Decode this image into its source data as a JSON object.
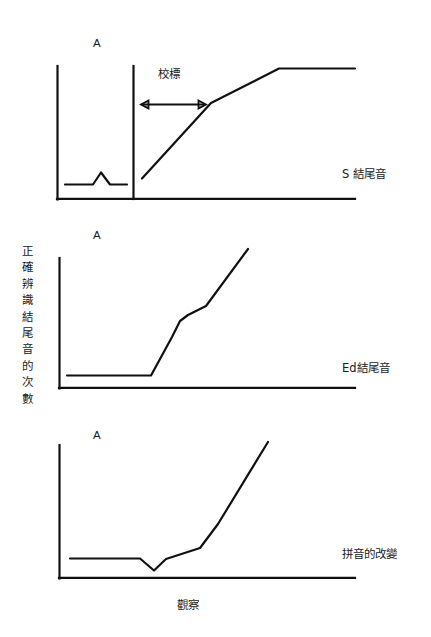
{
  "figure": {
    "y_axis_label": "正確辨識結尾音的次數",
    "y_axis_label_chars": [
      "正",
      "確",
      "辨",
      "識",
      "結",
      "尾",
      "音",
      "的",
      "次",
      "數"
    ],
    "x_axis_label": "觀察",
    "baseline_marker": "A",
    "criterion_label": "校標",
    "panels": [
      {
        "id": "panel-s-ending",
        "series_label": "S 結尾音",
        "phase_marker": "A",
        "criterion_label": "校標"
      },
      {
        "id": "panel-ed-ending",
        "series_label": "Ed結尾音",
        "phase_marker": "A"
      },
      {
        "id": "panel-spelling-change",
        "series_label": "拼音的改變",
        "phase_marker": "A"
      }
    ]
  },
  "chart_data": {
    "type": "line",
    "title": "",
    "xlabel": "觀察",
    "ylabel": "正確辨識結尾音的次數",
    "xlim": [
      0,
      100
    ],
    "ylim": [
      0,
      100
    ],
    "grid": false,
    "legend": "none",
    "annotations": [
      {
        "text": "校標",
        "panel": "panel-s-ending",
        "kind": "criterion-arrow-label"
      },
      {
        "text": "A",
        "panel": "panel-s-ending",
        "kind": "phase-marker"
      },
      {
        "text": "A",
        "panel": "panel-ed-ending",
        "kind": "phase-marker"
      },
      {
        "text": "A",
        "panel": "panel-spelling-change",
        "kind": "phase-marker"
      }
    ],
    "panels": [
      {
        "name": "S 結尾音",
        "phase_divider_x": 26,
        "series": [
          {
            "name": "baseline",
            "points": [
              [
                3,
                12
              ],
              [
                13,
                12
              ],
              [
                16,
                21
              ],
              [
                20,
                12
              ],
              [
                26,
                12
              ]
            ]
          },
          {
            "name": "intervention",
            "points": [
              [
                29,
                16
              ],
              [
                51,
                72
              ],
              [
                74,
                98
              ],
              [
                100,
                98
              ]
            ]
          }
        ]
      },
      {
        "name": "Ed結尾音",
        "series": [
          {
            "name": "observations",
            "points": [
              [
                3,
                10
              ],
              [
                31,
                10
              ],
              [
                40,
                47
              ],
              [
                42,
                52
              ],
              [
                49,
                62
              ],
              [
                64,
                100
              ]
            ]
          }
        ]
      },
      {
        "name": "拼音的改變",
        "series": [
          {
            "name": "observations",
            "points": [
              [
                5,
                15
              ],
              [
                28,
                15
              ],
              [
                32,
                6
              ],
              [
                36,
                15
              ],
              [
                47,
                23
              ],
              [
                53,
                42
              ],
              [
                70,
                100
              ]
            ]
          }
        ]
      }
    ]
  }
}
